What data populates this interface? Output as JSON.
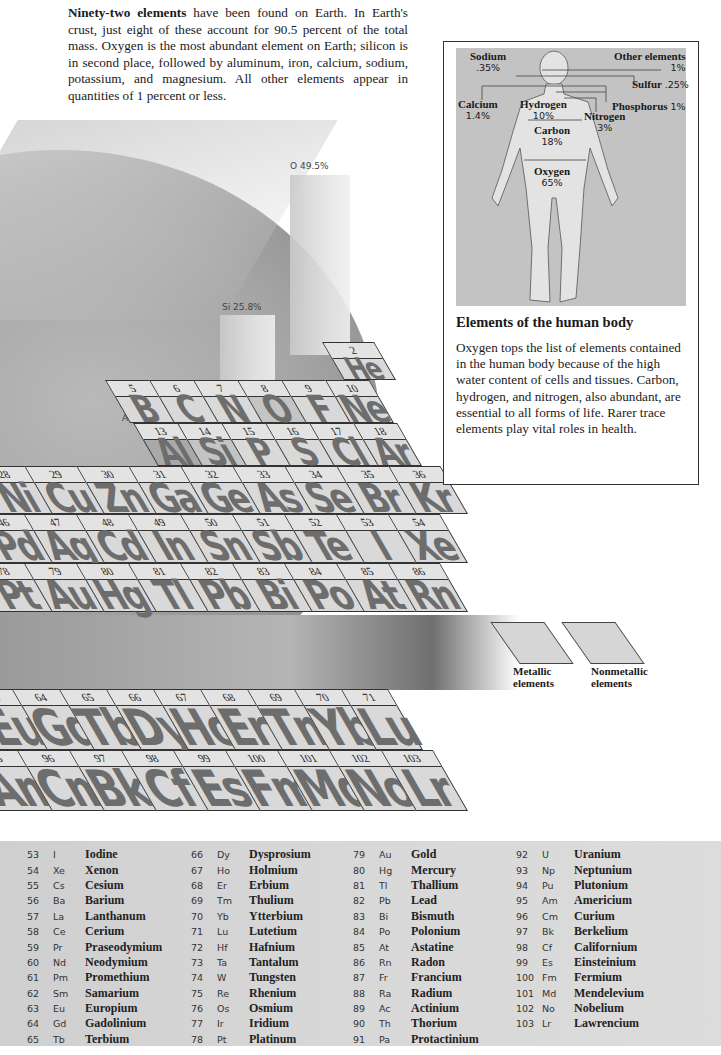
{
  "intro": {
    "lead": "Ninety-two elements",
    "text": " have been found on Earth. In Earth's crust, just eight of these account for 90.5 percent of the total mass. Oxygen is the most abundant element on Earth; silicon is in second place, followed by aluminum, iron, calcium, sodium, potassium, and magnesium. All other elements appear in quantities of 1 percent or less."
  },
  "crust_abundance": [
    {
      "symbol": "O",
      "label": "O  49.5%",
      "percent": 49.5
    },
    {
      "symbol": "Si",
      "label": "Si  25.8%",
      "percent": 25.8
    },
    {
      "symbol": "Al",
      "label": "Al  7.6%",
      "percent": 7.6
    }
  ],
  "periodic_rows": {
    "row_he": [
      {
        "n": "2",
        "s": "He"
      }
    ],
    "row_p2": [
      {
        "n": "5",
        "s": "B"
      },
      {
        "n": "6",
        "s": "C"
      },
      {
        "n": "7",
        "s": "N"
      },
      {
        "n": "8",
        "s": "O"
      },
      {
        "n": "9",
        "s": "F"
      },
      {
        "n": "10",
        "s": "Ne"
      }
    ],
    "row_p3": [
      {
        "n": "13",
        "s": "Al"
      },
      {
        "n": "14",
        "s": "Si"
      },
      {
        "n": "15",
        "s": "P"
      },
      {
        "n": "16",
        "s": "S"
      },
      {
        "n": "17",
        "s": "Cl"
      },
      {
        "n": "18",
        "s": "Ar"
      }
    ],
    "row_4": [
      {
        "n": "28",
        "s": "Ni"
      },
      {
        "n": "29",
        "s": "Cu"
      },
      {
        "n": "30",
        "s": "Zn"
      },
      {
        "n": "31",
        "s": "Ga"
      },
      {
        "n": "32",
        "s": "Ge"
      },
      {
        "n": "33",
        "s": "As"
      },
      {
        "n": "34",
        "s": "Se"
      },
      {
        "n": "35",
        "s": "Br"
      },
      {
        "n": "36",
        "s": "Kr"
      }
    ],
    "row_5": [
      {
        "n": "46",
        "s": "Pd"
      },
      {
        "n": "47",
        "s": "Ag"
      },
      {
        "n": "48",
        "s": "Cd"
      },
      {
        "n": "49",
        "s": "In"
      },
      {
        "n": "50",
        "s": "Sn"
      },
      {
        "n": "51",
        "s": "Sb"
      },
      {
        "n": "52",
        "s": "Te"
      },
      {
        "n": "53",
        "s": "I"
      },
      {
        "n": "54",
        "s": "Xe"
      }
    ],
    "row_6": [
      {
        "n": "78",
        "s": "Pt"
      },
      {
        "n": "79",
        "s": "Au"
      },
      {
        "n": "80",
        "s": "Hg"
      },
      {
        "n": "81",
        "s": "Tl"
      },
      {
        "n": "82",
        "s": "Pb"
      },
      {
        "n": "83",
        "s": "Bi"
      },
      {
        "n": "84",
        "s": "Po"
      },
      {
        "n": "85",
        "s": "At"
      },
      {
        "n": "86",
        "s": "Rn"
      }
    ],
    "row_lan": [
      {
        "n": "63",
        "s": "Eu"
      },
      {
        "n": "64",
        "s": "Gd"
      },
      {
        "n": "65",
        "s": "Tb"
      },
      {
        "n": "66",
        "s": "Dy"
      },
      {
        "n": "67",
        "s": "Ho"
      },
      {
        "n": "68",
        "s": "Er"
      },
      {
        "n": "69",
        "s": "Tm"
      },
      {
        "n": "70",
        "s": "Yb"
      },
      {
        "n": "71",
        "s": "Lu"
      }
    ],
    "row_act": [
      {
        "n": "95",
        "s": "Am"
      },
      {
        "n": "96",
        "s": "Cm"
      },
      {
        "n": "97",
        "s": "Bk"
      },
      {
        "n": "98",
        "s": "Cf"
      },
      {
        "n": "99",
        "s": "Es"
      },
      {
        "n": "100",
        "s": "Fm"
      },
      {
        "n": "101",
        "s": "Md"
      },
      {
        "n": "102",
        "s": "No"
      },
      {
        "n": "103",
        "s": "Lr"
      }
    ]
  },
  "legend": {
    "metallic": "Metallic elements",
    "metallic_l1": "Metallic",
    "metallic_l2": "elements",
    "nonmetallic_l1": "Nonmetallic",
    "nonmetallic_l2": "elements"
  },
  "human_body": {
    "title": "Elements of the human body",
    "text": "Oxygen tops the list of elements contained in the human body because of the high water content of cells and tissues. Carbon, hydrogen, and nitrogen, also abundant, are essential to all forms of life. Rarer trace elements play vital roles in health.",
    "labels": {
      "sodium": {
        "name": "Sodium",
        "pct": ".35%"
      },
      "calcium": {
        "name": "Calcium",
        "pct": "1.4%"
      },
      "hydrogen": {
        "name": "Hydrogen",
        "pct": "10%"
      },
      "carbon": {
        "name": "Carbon",
        "pct": "18%"
      },
      "oxygen": {
        "name": "Oxygen",
        "pct": "65%"
      },
      "nitrogen": {
        "name": "Nitrogen",
        "pct": "3%"
      },
      "other": {
        "name": "Other elements",
        "pct": "1%"
      },
      "sulfur": {
        "name": "Sulfur",
        "pct": ".25%"
      },
      "phosphorus": {
        "name": "Phosphorus",
        "pct": "1%"
      }
    }
  },
  "element_list": [
    [
      [
        "53",
        "I",
        "Iodine"
      ],
      [
        "54",
        "Xe",
        "Xenon"
      ],
      [
        "55",
        "Cs",
        "Cesium"
      ],
      [
        "56",
        "Ba",
        "Barium"
      ],
      [
        "57",
        "La",
        "Lanthanum"
      ],
      [
        "58",
        "Ce",
        "Cerium"
      ],
      [
        "59",
        "Pr",
        "Praseodymium"
      ],
      [
        "60",
        "Nd",
        "Neodymium"
      ],
      [
        "61",
        "Pm",
        "Promethium"
      ],
      [
        "62",
        "Sm",
        "Samarium"
      ],
      [
        "63",
        "Eu",
        "Europium"
      ],
      [
        "64",
        "Gd",
        "Gadolinium"
      ],
      [
        "65",
        "Tb",
        "Terbium"
      ]
    ],
    [
      [
        "66",
        "Dy",
        "Dysprosium"
      ],
      [
        "67",
        "Ho",
        "Holmium"
      ],
      [
        "68",
        "Er",
        "Erbium"
      ],
      [
        "69",
        "Tm",
        "Thulium"
      ],
      [
        "70",
        "Yb",
        "Ytterbium"
      ],
      [
        "71",
        "Lu",
        "Lutetium"
      ],
      [
        "72",
        "Hf",
        "Hafnium"
      ],
      [
        "73",
        "Ta",
        "Tantalum"
      ],
      [
        "74",
        "W",
        "Tungsten"
      ],
      [
        "75",
        "Re",
        "Rhenium"
      ],
      [
        "76",
        "Os",
        "Osmium"
      ],
      [
        "77",
        "Ir",
        "Iridium"
      ],
      [
        "78",
        "Pt",
        "Platinum"
      ]
    ],
    [
      [
        "79",
        "Au",
        "Gold"
      ],
      [
        "80",
        "Hg",
        "Mercury"
      ],
      [
        "81",
        "Tl",
        "Thallium"
      ],
      [
        "82",
        "Pb",
        "Lead"
      ],
      [
        "83",
        "Bi",
        "Bismuth"
      ],
      [
        "84",
        "Po",
        "Polonium"
      ],
      [
        "85",
        "At",
        "Astatine"
      ],
      [
        "86",
        "Rn",
        "Radon"
      ],
      [
        "87",
        "Fr",
        "Francium"
      ],
      [
        "88",
        "Ra",
        "Radium"
      ],
      [
        "89",
        "Ac",
        "Actinium"
      ],
      [
        "90",
        "Th",
        "Thorium"
      ],
      [
        "91",
        "Pa",
        "Protactinium"
      ]
    ],
    [
      [
        "92",
        "U",
        "Uranium"
      ],
      [
        "93",
        "Np",
        "Neptunium"
      ],
      [
        "94",
        "Pu",
        "Plutonium"
      ],
      [
        "95",
        "Am",
        "Americium"
      ],
      [
        "96",
        "Cm",
        "Curium"
      ],
      [
        "97",
        "Bk",
        "Berkelium"
      ],
      [
        "98",
        "Cf",
        "Californium"
      ],
      [
        "99",
        "Es",
        "Einsteinium"
      ],
      [
        "100",
        "Fm",
        "Fermium"
      ],
      [
        "101",
        "Md",
        "Mendelevium"
      ],
      [
        "102",
        "No",
        "Nobelium"
      ],
      [
        "103",
        "Lr",
        "Lawrencium"
      ]
    ]
  ]
}
